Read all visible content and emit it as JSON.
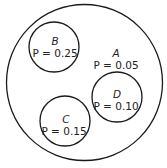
{
  "diagram": {
    "type": "venn-partition",
    "regions": [
      {
        "id": "A",
        "name": "A",
        "prob_label": "P = 0.05",
        "probability": 0.05
      },
      {
        "id": "B",
        "name": "B",
        "prob_label": "P = 0.25",
        "probability": 0.25
      },
      {
        "id": "C",
        "name": "C",
        "prob_label": "P = 0.15",
        "probability": 0.15
      },
      {
        "id": "D",
        "name": "D",
        "prob_label": "P = 0.10",
        "probability": 0.1
      }
    ]
  }
}
